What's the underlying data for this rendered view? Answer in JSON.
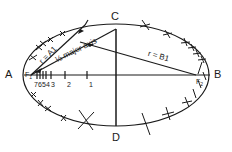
{
  "diagram": {
    "title": "",
    "type": "ellipse construction (trammel / foci method)",
    "points": {
      "A": "A",
      "B": "B",
      "C": "C",
      "D": "D",
      "F1": "F",
      "F1_sub": "1",
      "F2": "F",
      "F2_sub": "2"
    },
    "labels": {
      "half_major_axis": "½ major axis",
      "r_a1": "r = A1",
      "r_b1": "r = B1"
    },
    "ticks": [
      "7",
      "6",
      "5",
      "4",
      "3",
      "2",
      "1"
    ],
    "colors": {
      "line": "#1a1a1a",
      "background": "#ffffff"
    }
  }
}
